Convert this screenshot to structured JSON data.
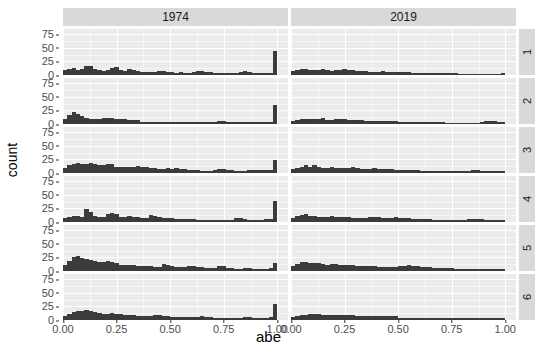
{
  "chart_data": {
    "type": "bar",
    "title": "",
    "subtitle": "",
    "xlabel": "abe",
    "ylabel": "count",
    "xlim": [
      0,
      1.05
    ],
    "ylim": [
      0,
      85
    ],
    "grid": true,
    "legend_position": "none",
    "facet": {
      "col_variable": "year",
      "row_variable": "group",
      "col_labels": [
        "1974",
        "2019"
      ],
      "row_labels": [
        "1",
        "2",
        "3",
        "4",
        "5",
        "6"
      ],
      "strip_bg": "#d9d9d9",
      "panel_bg": "#ebebeb",
      "gridline_color": "#ffffff"
    },
    "bar_color": "#3b3b3b",
    "x_ticks": [
      {
        "value": 0.0,
        "label": "0.00"
      },
      {
        "value": 0.25,
        "label": "0.25"
      },
      {
        "value": 0.5,
        "label": "0.50"
      },
      {
        "value": 0.75,
        "label": "0.75"
      },
      {
        "value": 1.0,
        "label": "1.00"
      }
    ],
    "y_ticks": [
      {
        "value": 0,
        "label": "0"
      },
      {
        "value": 25,
        "label": "25"
      },
      {
        "value": 50,
        "label": "50"
      },
      {
        "value": 75,
        "label": "75"
      }
    ],
    "bin_width": 0.02,
    "bin_centers": [
      0.01,
      0.03,
      0.05,
      0.07,
      0.09,
      0.11,
      0.13,
      0.15,
      0.17,
      0.19,
      0.21,
      0.23,
      0.25,
      0.27,
      0.29,
      0.31,
      0.33,
      0.35,
      0.37,
      0.39,
      0.41,
      0.43,
      0.45,
      0.47,
      0.49,
      0.51,
      0.53,
      0.55,
      0.57,
      0.59,
      0.61,
      0.63,
      0.65,
      0.67,
      0.69,
      0.71,
      0.73,
      0.75,
      0.77,
      0.79,
      0.81,
      0.83,
      0.85,
      0.87,
      0.89,
      0.91,
      0.93,
      0.95,
      0.97,
      0.99
    ],
    "panels": [
      {
        "row": "1",
        "col": "1974",
        "values": [
          9,
          11,
          13,
          10,
          12,
          16,
          17,
          12,
          9,
          8,
          10,
          13,
          14,
          9,
          8,
          11,
          9,
          7,
          6,
          5,
          5,
          6,
          7,
          8,
          6,
          5,
          4,
          5,
          4,
          4,
          6,
          7,
          7,
          6,
          5,
          4,
          4,
          3,
          3,
          3,
          4,
          6,
          7,
          5,
          4,
          3,
          3,
          3,
          3,
          45
        ]
      },
      {
        "row": "1",
        "col": "2019",
        "values": [
          7,
          9,
          11,
          12,
          10,
          9,
          10,
          11,
          10,
          8,
          9,
          10,
          12,
          10,
          9,
          8,
          7,
          7,
          6,
          6,
          6,
          7,
          6,
          6,
          5,
          5,
          5,
          5,
          4,
          4,
          4,
          4,
          4,
          4,
          3,
          3,
          3,
          3,
          3,
          2,
          2,
          2,
          2,
          2,
          2,
          2,
          2,
          2,
          2,
          4
        ]
      },
      {
        "row": "2",
        "col": "1974",
        "values": [
          10,
          16,
          22,
          19,
          14,
          12,
          10,
          9,
          10,
          11,
          12,
          11,
          10,
          9,
          9,
          8,
          7,
          7,
          3,
          3,
          3,
          3,
          3,
          3,
          3,
          3,
          3,
          4,
          4,
          4,
          3,
          3,
          3,
          3,
          3,
          3,
          6,
          6,
          3,
          3,
          3,
          3,
          3,
          3,
          4,
          4,
          3,
          3,
          3,
          35
        ]
      },
      {
        "row": "2",
        "col": "2019",
        "values": [
          6,
          8,
          10,
          9,
          9,
          10,
          9,
          11,
          8,
          8,
          9,
          9,
          9,
          8,
          7,
          7,
          7,
          6,
          6,
          6,
          5,
          5,
          5,
          5,
          5,
          4,
          4,
          4,
          4,
          3,
          3,
          3,
          3,
          3,
          3,
          3,
          2,
          2,
          2,
          2,
          2,
          2,
          2,
          2,
          3,
          5,
          6,
          5,
          4,
          4
        ]
      },
      {
        "row": "3",
        "col": "1974",
        "values": [
          9,
          14,
          17,
          18,
          16,
          17,
          18,
          16,
          14,
          14,
          17,
          16,
          12,
          11,
          12,
          11,
          12,
          13,
          12,
          11,
          10,
          9,
          8,
          8,
          9,
          8,
          9,
          8,
          7,
          6,
          5,
          5,
          4,
          4,
          4,
          6,
          7,
          7,
          6,
          5,
          4,
          4,
          4,
          5,
          6,
          6,
          5,
          5,
          5,
          24
        ]
      },
      {
        "row": "3",
        "col": "2019",
        "values": [
          7,
          9,
          12,
          15,
          11,
          14,
          12,
          10,
          9,
          11,
          10,
          9,
          9,
          10,
          11,
          9,
          8,
          8,
          8,
          9,
          8,
          7,
          7,
          7,
          6,
          6,
          6,
          5,
          5,
          5,
          4,
          4,
          4,
          4,
          4,
          3,
          3,
          3,
          3,
          3,
          3,
          4,
          5,
          5,
          4,
          4,
          4,
          3,
          3,
          3
        ]
      },
      {
        "row": "4",
        "col": "1974",
        "values": [
          7,
          9,
          12,
          11,
          10,
          24,
          18,
          12,
          10,
          9,
          15,
          16,
          14,
          10,
          9,
          11,
          10,
          9,
          8,
          8,
          13,
          12,
          9,
          8,
          7,
          7,
          6,
          6,
          5,
          5,
          5,
          4,
          4,
          4,
          3,
          3,
          3,
          3,
          3,
          3,
          7,
          8,
          5,
          4,
          3,
          3,
          3,
          5,
          6,
          38
        ]
      },
      {
        "row": "4",
        "col": "2019",
        "values": [
          8,
          11,
          13,
          14,
          12,
          11,
          10,
          9,
          10,
          11,
          10,
          9,
          9,
          9,
          8,
          8,
          8,
          8,
          9,
          10,
          9,
          8,
          7,
          8,
          9,
          8,
          7,
          7,
          6,
          6,
          5,
          5,
          5,
          4,
          4,
          4,
          4,
          4,
          3,
          3,
          4,
          5,
          6,
          5,
          5,
          4,
          4,
          4,
          4,
          4
        ]
      },
      {
        "row": "5",
        "col": "1974",
        "values": [
          12,
          18,
          26,
          28,
          24,
          22,
          20,
          19,
          17,
          16,
          18,
          17,
          14,
          12,
          12,
          11,
          11,
          10,
          9,
          9,
          9,
          8,
          8,
          13,
          12,
          9,
          8,
          8,
          8,
          9,
          9,
          8,
          7,
          6,
          6,
          5,
          10,
          10,
          6,
          5,
          4,
          4,
          5,
          5,
          4,
          4,
          4,
          4,
          5,
          14
        ]
      },
      {
        "row": "5",
        "col": "2019",
        "values": [
          9,
          13,
          16,
          17,
          15,
          14,
          14,
          13,
          12,
          13,
          13,
          12,
          11,
          11,
          11,
          10,
          10,
          9,
          9,
          9,
          8,
          8,
          8,
          8,
          8,
          9,
          10,
          11,
          10,
          9,
          8,
          7,
          7,
          6,
          6,
          5,
          5,
          5,
          4,
          4,
          4,
          4,
          4,
          4,
          4,
          4,
          4,
          4,
          4,
          4
        ]
      },
      {
        "row": "6",
        "col": "1974",
        "values": [
          8,
          11,
          14,
          16,
          17,
          18,
          16,
          14,
          13,
          12,
          12,
          13,
          12,
          11,
          10,
          9,
          9,
          8,
          8,
          8,
          8,
          9,
          9,
          8,
          7,
          6,
          6,
          5,
          5,
          5,
          5,
          6,
          7,
          6,
          5,
          4,
          4,
          4,
          3,
          3,
          3,
          4,
          5,
          5,
          4,
          4,
          4,
          4,
          5,
          30
        ]
      },
      {
        "row": "6",
        "col": "2019",
        "values": [
          5,
          7,
          9,
          10,
          11,
          12,
          11,
          10,
          9,
          9,
          10,
          10,
          9,
          9,
          9,
          8,
          8,
          8,
          8,
          8,
          7,
          7,
          7,
          7,
          7,
          4,
          3,
          3,
          3,
          3,
          3,
          3,
          3,
          3,
          3,
          3,
          3,
          3,
          3,
          3,
          3,
          3,
          3,
          3,
          3,
          3,
          3,
          3,
          3,
          3
        ]
      }
    ]
  }
}
